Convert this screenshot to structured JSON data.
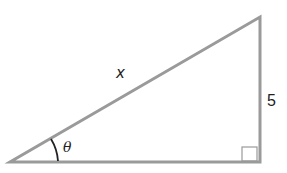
{
  "figure": {
    "type": "right-triangle",
    "labels": {
      "hypotenuse": "x",
      "opposite_side": "5",
      "angle": "θ"
    },
    "right_angle_marker": true,
    "colors": {
      "stroke": "#9a9a9a",
      "arc": "#222222",
      "text": "#222222"
    }
  }
}
